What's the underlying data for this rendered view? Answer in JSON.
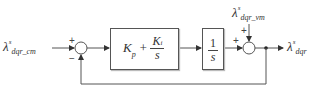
{
  "diagram": {
    "type": "control block diagram",
    "input": {
      "symbol": "λ",
      "sup": "s",
      "sub": "dqr_cm"
    },
    "disturbance_input": {
      "symbol": "λ",
      "sup": "s",
      "sub": "dqr_vm"
    },
    "output": {
      "symbol": "λ",
      "sup": "s",
      "sub": "dqr"
    },
    "sum1": {
      "signs": [
        "+",
        "−"
      ]
    },
    "sum2": {
      "signs": [
        "+",
        "+"
      ]
    },
    "blocks": [
      {
        "name": "PI controller",
        "kp": "K",
        "kp_sub": "p",
        "plus": "+",
        "ki": "K",
        "ki_sub": "i",
        "den": "s"
      },
      {
        "name": "integrator",
        "num": "1",
        "den": "s"
      }
    ],
    "feedback": "output fed back to negative input of first summing junction"
  },
  "colors": {
    "line": "#555555",
    "text": "#333333",
    "background": "#ffffff"
  }
}
